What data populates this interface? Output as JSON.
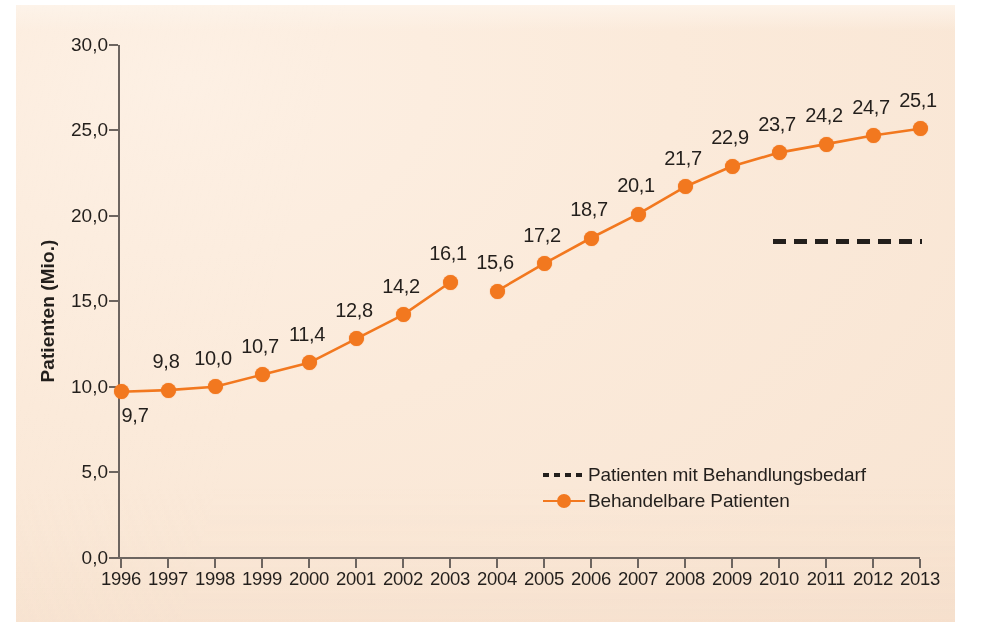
{
  "figure": {
    "paper_color": "#fbeada",
    "accent_color": "#f2781f",
    "ink_color": "#231f1c"
  },
  "chart_data": {
    "type": "line",
    "title": "",
    "xlabel": "",
    "ylabel": "Patienten (Mio.)",
    "grid": false,
    "legend_position": "inside-bottom-center",
    "categories": [
      "1996",
      "1997",
      "1998",
      "1999",
      "2000",
      "2001",
      "2002",
      "2003",
      "2004",
      "2005",
      "2006",
      "2007",
      "2008",
      "2009",
      "2010",
      "2011",
      "2012",
      "2013"
    ],
    "ylim": [
      0,
      30
    ],
    "yticks": [
      "0,0",
      "5,0",
      "10,0",
      "15,0",
      "20,0",
      "25,0",
      "30,0"
    ],
    "ytick_values": [
      0,
      5,
      10,
      15,
      20,
      25,
      30
    ],
    "series": [
      {
        "name": "Behandelbare Patienten",
        "style": "solid-with-markers",
        "color": "#f2781f",
        "break_after_category": "2003",
        "values": [
          9.7,
          9.8,
          10.0,
          10.7,
          11.4,
          12.8,
          14.2,
          16.1,
          15.6,
          17.2,
          18.7,
          20.1,
          21.7,
          22.9,
          23.7,
          24.2,
          24.7,
          25.1
        ],
        "point_labels": [
          "9,7",
          "9,8",
          "10,0",
          "10,7",
          "11,4",
          "12,8",
          "14,2",
          "16,1",
          "15,6",
          "17,2",
          "18,7",
          "20,1",
          "21,7",
          "22,9",
          "23,7",
          "24,2",
          "24,7",
          "25,1"
        ]
      },
      {
        "name": "Patienten mit Behandlungsbedarf",
        "style": "dashed",
        "color": "#231f1c",
        "segment_value": 18.5,
        "segment_x_from": "2010",
        "segment_x_to": "2013"
      }
    ]
  },
  "legend": {
    "items": [
      {
        "label": "Patienten mit Behandlungsbedarf",
        "marker": "dashed-line"
      },
      {
        "label": "Behandelbare Patienten",
        "marker": "line-with-dot"
      }
    ]
  }
}
